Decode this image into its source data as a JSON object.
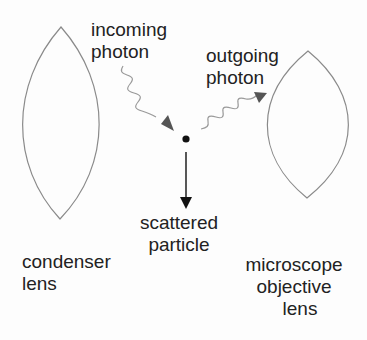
{
  "diagram": {
    "colors": {
      "background": "#fdfdfd",
      "lens_stroke": "#8a8a8a",
      "wave_stroke": "#9a9a9a",
      "photon_arrowhead": "#555555",
      "particle": "#111111",
      "particle_arrow": "#111111",
      "text": "#222222"
    },
    "nodes": [
      {
        "id": "condenser_lens",
        "type": "lens",
        "label_lines": [
          "condenser",
          "lens"
        ]
      },
      {
        "id": "objective_lens",
        "type": "lens",
        "label_lines": [
          "microscope",
          "objective",
          "lens"
        ]
      },
      {
        "id": "particle",
        "type": "dot",
        "label_lines": [
          "scattered",
          "particle"
        ]
      }
    ],
    "edges": [
      {
        "from": "source",
        "to": "particle",
        "style": "wavy-arrow",
        "label_lines": [
          "incoming",
          "photon"
        ]
      },
      {
        "from": "particle",
        "to": "objective_lens",
        "style": "wavy-arrow",
        "label_lines": [
          "outgoing",
          "photon"
        ]
      },
      {
        "from": "particle",
        "to": "down",
        "style": "straight-arrow",
        "label_lines": [
          "scattered",
          "particle"
        ]
      }
    ]
  },
  "labels": {
    "incoming_photon": {
      "line1": "incoming",
      "line2": "photon"
    },
    "outgoing_photon": {
      "line1": "outgoing",
      "line2": "photon"
    },
    "scattered_particle": {
      "line1": "scattered",
      "line2": "particle"
    },
    "condenser_lens": {
      "line1": "condenser",
      "line2": "lens"
    },
    "objective_lens": {
      "line1": "microscope",
      "line2": "objective",
      "line3": "lens"
    }
  }
}
